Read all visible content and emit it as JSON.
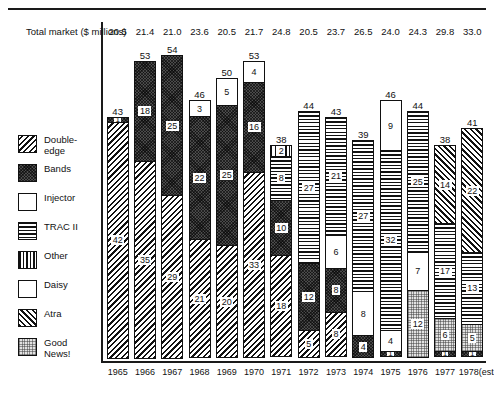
{
  "header": {
    "total_market_label": "Total market\n($ millions)"
  },
  "legend": {
    "items": [
      {
        "label": "Double-\nedge",
        "key": "double-edge",
        "pattern": "dark-diagonal-hatch"
      },
      {
        "label": "Bands",
        "key": "bands",
        "pattern": "dark-checker"
      },
      {
        "label": "Injector",
        "key": "injector",
        "pattern": "white"
      },
      {
        "label": "TRAC II",
        "key": "tracii",
        "pattern": "horizontal-lines"
      },
      {
        "label": "Other",
        "key": "other",
        "pattern": "vertical-lines"
      },
      {
        "label": "Daisy",
        "key": "daisy",
        "pattern": "white"
      },
      {
        "label": "Atra",
        "key": "atra",
        "pattern": "forward-diagonal-hatch"
      },
      {
        "label": "Good\nNews!",
        "key": "goodnews",
        "pattern": "light-stipple"
      }
    ]
  },
  "chart_data": {
    "type": "bar",
    "subtype": "stacked-bar",
    "title": "",
    "xlabel": "",
    "ylabel": "",
    "grid": false,
    "legend_position": "left",
    "ylim": [
      0,
      60
    ],
    "categories": [
      "1965",
      "1966",
      "1967",
      "1968",
      "1969",
      "1970",
      "1971",
      "1972",
      "1973",
      "1974",
      "1975",
      "1976",
      "1977",
      "1978(est.)"
    ],
    "total_market_millions": [
      20.5,
      21.4,
      21.0,
      23.6,
      20.5,
      21.7,
      24.8,
      20.5,
      23.7,
      26.5,
      24.0,
      24.3,
      29.8,
      33.0
    ],
    "totals": [
      43,
      53,
      54,
      46,
      50,
      53,
      38,
      44,
      43,
      39,
      46,
      44,
      38,
      41
    ],
    "series": [
      {
        "name": "Double-edge",
        "key": "double-edge",
        "values": [
          42,
          35,
          29,
          21,
          20,
          33,
          18,
          5,
          8,
          0,
          0,
          0,
          0,
          0
        ]
      },
      {
        "name": "Bands",
        "key": "bands",
        "values": [
          1,
          18,
          25,
          22,
          25,
          16,
          10,
          12,
          8,
          4,
          1,
          0,
          1,
          1
        ]
      },
      {
        "name": "Injector",
        "key": "injector",
        "values": [
          0,
          0,
          0,
          3,
          5,
          4,
          0,
          0,
          0,
          0,
          9,
          0,
          0,
          0
        ]
      },
      {
        "name": "TRAC II",
        "key": "tracii",
        "values": [
          0,
          0,
          0,
          0,
          0,
          0,
          8,
          27,
          21,
          27,
          32,
          25,
          17,
          13
        ]
      },
      {
        "name": "Other",
        "key": "other",
        "values": [
          0,
          0,
          0,
          0,
          0,
          0,
          2,
          0,
          0,
          0,
          0,
          0,
          0,
          0
        ]
      },
      {
        "name": "Daisy",
        "key": "daisy",
        "values": [
          0,
          0,
          0,
          0,
          0,
          0,
          0,
          0,
          6,
          8,
          4,
          7,
          0,
          0
        ]
      },
      {
        "name": "Atra",
        "key": "atra",
        "values": [
          0,
          0,
          0,
          0,
          0,
          0,
          0,
          0,
          0,
          0,
          0,
          0,
          14,
          22
        ]
      },
      {
        "name": "Good News!",
        "key": "goodnews",
        "values": [
          0,
          0,
          0,
          0,
          0,
          0,
          0,
          0,
          0,
          0,
          0,
          12,
          6,
          5
        ]
      }
    ],
    "columns": [
      {
        "year": "1965",
        "total": 43,
        "segments": [
          {
            "key": "double-edge",
            "value": 42
          },
          {
            "key": "bands",
            "value": 1
          }
        ]
      },
      {
        "year": "1966",
        "total": 53,
        "segments": [
          {
            "key": "double-edge",
            "value": 35
          },
          {
            "key": "bands",
            "value": 18
          }
        ]
      },
      {
        "year": "1967",
        "total": 54,
        "segments": [
          {
            "key": "double-edge",
            "value": 29
          },
          {
            "key": "bands",
            "value": 25
          }
        ]
      },
      {
        "year": "1968",
        "total": 46,
        "segments": [
          {
            "key": "double-edge",
            "value": 21
          },
          {
            "key": "bands",
            "value": 22
          },
          {
            "key": "injector",
            "value": 3
          }
        ]
      },
      {
        "year": "1969",
        "total": 50,
        "segments": [
          {
            "key": "double-edge",
            "value": 20
          },
          {
            "key": "bands",
            "value": 25
          },
          {
            "key": "injector",
            "value": 5
          }
        ]
      },
      {
        "year": "1970",
        "total": 53,
        "segments": [
          {
            "key": "double-edge",
            "value": 33
          },
          {
            "key": "bands",
            "value": 16
          },
          {
            "key": "injector",
            "value": 4
          }
        ]
      },
      {
        "year": "1971",
        "total": 38,
        "segments": [
          {
            "key": "double-edge",
            "value": 18
          },
          {
            "key": "bands",
            "value": 10
          },
          {
            "key": "tracii",
            "value": 8
          },
          {
            "key": "other",
            "value": 2
          }
        ]
      },
      {
        "year": "1972",
        "total": 44,
        "segments": [
          {
            "key": "double-edge",
            "value": 5
          },
          {
            "key": "bands",
            "value": 12
          },
          {
            "key": "tracii",
            "value": 27
          }
        ]
      },
      {
        "year": "1973",
        "total": 43,
        "segments": [
          {
            "key": "double-edge",
            "value": 8
          },
          {
            "key": "bands",
            "value": 8
          },
          {
            "key": "daisy",
            "value": 6
          },
          {
            "key": "tracii",
            "value": 21
          }
        ]
      },
      {
        "year": "1974",
        "total": 39,
        "segments": [
          {
            "key": "bands",
            "value": 4
          },
          {
            "key": "daisy",
            "value": 8
          },
          {
            "key": "tracii",
            "value": 27
          }
        ]
      },
      {
        "year": "1975",
        "total": 46,
        "segments": [
          {
            "key": "bands",
            "value": 1
          },
          {
            "key": "daisy",
            "value": 4
          },
          {
            "key": "tracii",
            "value": 32
          },
          {
            "key": "injector",
            "value": 9
          }
        ]
      },
      {
        "year": "1976",
        "total": 44,
        "segments": [
          {
            "key": "goodnews",
            "value": 12
          },
          {
            "key": "daisy",
            "value": 7
          },
          {
            "key": "tracii",
            "value": 25
          }
        ]
      },
      {
        "year": "1977",
        "total": 38,
        "segments": [
          {
            "key": "bands",
            "value": 1
          },
          {
            "key": "goodnews",
            "value": 6
          },
          {
            "key": "tracii",
            "value": 17
          },
          {
            "key": "atra",
            "value": 14
          }
        ]
      },
      {
        "year": "1978(est.)",
        "total": 41,
        "segments": [
          {
            "key": "bands",
            "value": 1
          },
          {
            "key": "goodnews",
            "value": 5
          },
          {
            "key": "tracii",
            "value": 13
          },
          {
            "key": "atra",
            "value": 22
          }
        ]
      }
    ]
  }
}
